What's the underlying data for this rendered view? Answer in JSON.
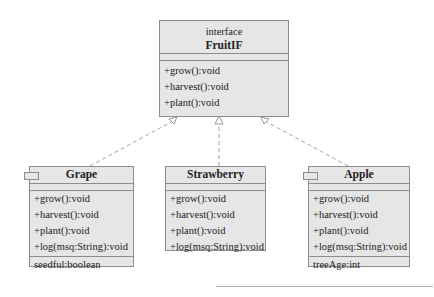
{
  "diagram": {
    "type": "uml-class",
    "interface": {
      "stereotype": "interface",
      "name": "FruitIF",
      "operations": [
        "+grow():void",
        "+harvest():void",
        "+plant():void"
      ]
    },
    "classes": [
      {
        "name": "Grape",
        "operations": [
          "+grow():void",
          "+harvest():void",
          "+plant():void",
          "+log(msq:String):void"
        ],
        "attributes": [
          "seedful:boolean"
        ]
      },
      {
        "name": "Strawberry",
        "operations": [
          "+grow():void",
          "+harvest():void",
          "+plant():void",
          "+log(msq:String):void"
        ],
        "attributes": []
      },
      {
        "name": "Apple",
        "operations": [
          "+grow():void",
          "+harvest():void",
          "+plant():void",
          "+log(msq:String):void"
        ],
        "attributes": [
          "treeAge:int"
        ]
      }
    ],
    "relationships": [
      {
        "from": "Grape",
        "to": "FruitIF",
        "type": "realization"
      },
      {
        "from": "Strawberry",
        "to": "FruitIF",
        "type": "realization"
      },
      {
        "from": "Apple",
        "to": "FruitIF",
        "type": "realization"
      }
    ],
    "colors": {
      "box_fill": "#e6e6e6",
      "box_border": "#8c8c8c",
      "edge": "#a0a0a0"
    }
  }
}
